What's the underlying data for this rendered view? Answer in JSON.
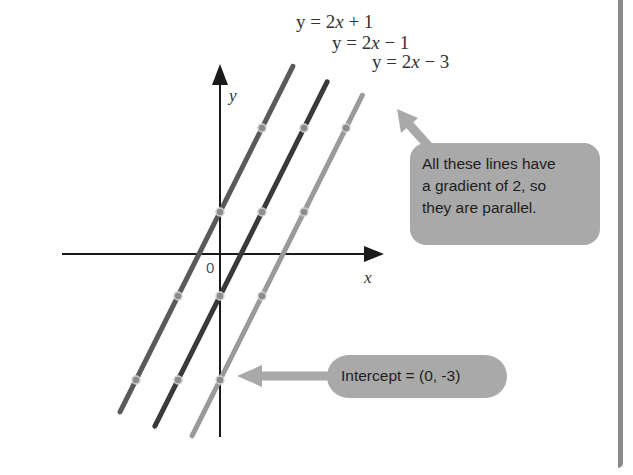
{
  "diagram": {
    "type": "coordinate-graph",
    "axes": {
      "x_label": "x",
      "y_label": "y",
      "origin_label": "0"
    },
    "lines": [
      {
        "id": "line-2x-plus-1",
        "equation_prefix": "y = 2",
        "equation_var": "x",
        "equation_suffix": " + 1",
        "gradient": 2,
        "intercept": 1,
        "color": "#5a5a5a",
        "points": [
          [
            -2,
            -3
          ],
          [
            -1,
            -1
          ],
          [
            0,
            1
          ],
          [
            1,
            3
          ]
        ]
      },
      {
        "id": "line-2x-minus-1",
        "equation_prefix": "y = 2",
        "equation_var": "x",
        "equation_suffix": " − 1",
        "gradient": 2,
        "intercept": -1,
        "color": "#3a3a3a",
        "points": [
          [
            -1,
            -3
          ],
          [
            0,
            -1
          ],
          [
            1,
            1
          ],
          [
            2,
            3
          ]
        ]
      },
      {
        "id": "line-2x-minus-3",
        "equation_prefix": "y = 2",
        "equation_var": "x",
        "equation_suffix": " − 3",
        "gradient": 2,
        "intercept": -3,
        "color": "#9a9a9a",
        "points": [
          [
            0,
            -3
          ],
          [
            1,
            -1
          ],
          [
            2,
            1
          ],
          [
            3,
            3
          ]
        ]
      }
    ],
    "callouts": {
      "parallel": {
        "lines": [
          "All these lines have",
          "a gradient of 2, so",
          "they are parallel."
        ]
      },
      "intercept": {
        "text": "Intercept = (0, -3)"
      }
    },
    "colors": {
      "callout_fill": "#a9a9a9",
      "axis": "#1a1a1a",
      "point_fill": "#8c8c8c",
      "point_stroke": "#d0d0d0"
    }
  }
}
